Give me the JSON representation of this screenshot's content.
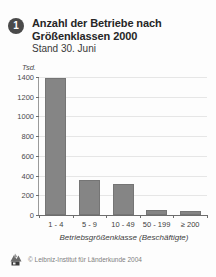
{
  "figure": {
    "badge_number": "1",
    "title": "Anzahl der Betriebe nach Größenklassen 2000",
    "subtitle": "Stand 30. Juni"
  },
  "footer": {
    "logo_icon": "leibniz-institut-logo-icon",
    "copyright": "© Leibniz-Institut für Länderkunde 2004"
  },
  "colors": {
    "bar_fill": "#858585",
    "bar_stroke": "#757575",
    "grid": "#e6e6e6",
    "axis": "#6d6d6d",
    "badge": "#4a4a4a",
    "text": "#2b2b2b"
  },
  "chart_data": {
    "type": "bar",
    "title": "Anzahl der Betriebe nach Größenklassen 2000",
    "subtitle": "Stand 30. Juni",
    "xlabel": "Betriebsgrößenklasse (Beschäftigte)",
    "ylabel": "Tsd.",
    "unit": "Tsd.",
    "categories": [
      "1 - 4",
      "5 - 9",
      "10 - 49",
      "50 - 199",
      "≥ 200"
    ],
    "values": [
      1395,
      360,
      310,
      55,
      45
    ],
    "ylim": [
      0,
      1400
    ],
    "yticks": [
      0,
      200,
      400,
      600,
      800,
      1000,
      1200,
      1400
    ],
    "ytick_labels": [
      "0",
      "200",
      "400",
      "600",
      "800",
      "1000",
      "1200",
      "1400"
    ],
    "grid": true,
    "legend": "none"
  }
}
